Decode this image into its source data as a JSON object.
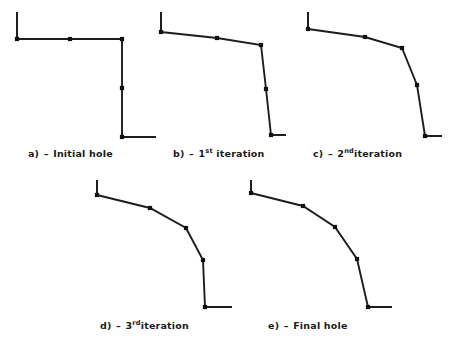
{
  "figure": {
    "kind": "line-diagram-multipanel",
    "background_color": "#ffffff",
    "stroke_color": "#1d1d1d",
    "node_color": "#101010",
    "panel_count": 5
  },
  "captions": {
    "a": {
      "label": "a)",
      "dash": "–",
      "text": "Initial hole",
      "sup": ""
    },
    "b": {
      "label": "b)",
      "dash": "–",
      "text": "1",
      "sup": "st",
      "tail": " iteration"
    },
    "c": {
      "label": "c)",
      "dash": "–",
      "text": "2",
      "sup": "nd",
      "tail": "iteration"
    },
    "d": {
      "label": "d)",
      "dash": "–",
      "text": "3",
      "sup": "rd",
      "tail": "iteration"
    },
    "e": {
      "label": "e)",
      "dash": "–",
      "text": "Final hole",
      "sup": ""
    }
  },
  "chart_data": {
    "type": "line",
    "title": "",
    "xlabel": "",
    "ylabel": "",
    "grid": false,
    "legend": "none",
    "axis_note": "schematic hole-profile shapes, pixel coordinates of the 467x355 canvas",
    "xlim": [
      0,
      467
    ],
    "ylim": [
      355,
      0
    ],
    "panels": [
      {
        "id": "a",
        "caption": "a) - Initial hole",
        "stub_top": [
          [
            17,
            12
          ],
          [
            17,
            39
          ]
        ],
        "profile": [
          [
            17,
            39
          ],
          [
            70,
            39
          ],
          [
            122,
            39
          ],
          [
            122,
            88
          ],
          [
            122,
            137
          ]
        ],
        "nodes": [
          [
            17,
            39
          ],
          [
            70,
            39
          ],
          [
            122,
            39
          ],
          [
            122,
            88
          ],
          [
            122,
            137
          ]
        ],
        "stub_bottom": [
          [
            122,
            137
          ],
          [
            156,
            137
          ]
        ]
      },
      {
        "id": "b",
        "caption": "b) - 1st iteration",
        "stub_top": [
          [
            161,
            12
          ],
          [
            161,
            32
          ]
        ],
        "profile": [
          [
            161,
            32
          ],
          [
            217,
            38
          ],
          [
            261,
            45
          ],
          [
            266,
            89
          ],
          [
            271,
            135
          ]
        ],
        "nodes": [
          [
            161,
            32
          ],
          [
            217,
            38
          ],
          [
            261,
            45
          ],
          [
            266,
            89
          ],
          [
            271,
            135
          ]
        ],
        "stub_bottom": [
          [
            271,
            135
          ],
          [
            286,
            135
          ]
        ]
      },
      {
        "id": "c",
        "caption": "c) - 2nd iteration",
        "stub_top": [
          [
            308,
            12
          ],
          [
            308,
            29
          ]
        ],
        "profile": [
          [
            308,
            29
          ],
          [
            365,
            37
          ],
          [
            402,
            48
          ],
          [
            417,
            85
          ],
          [
            425,
            136
          ]
        ],
        "nodes": [
          [
            308,
            29
          ],
          [
            365,
            37
          ],
          [
            402,
            48
          ],
          [
            417,
            85
          ],
          [
            425,
            136
          ]
        ],
        "stub_bottom": [
          [
            425,
            136
          ],
          [
            442,
            136
          ]
        ]
      },
      {
        "id": "d",
        "caption": "d) - 3rd iteration",
        "stub_top": [
          [
            97,
            180
          ],
          [
            97,
            195
          ]
        ],
        "profile": [
          [
            97,
            195
          ],
          [
            150,
            208
          ],
          [
            186,
            228
          ],
          [
            203,
            260
          ],
          [
            205,
            307
          ]
        ],
        "nodes": [
          [
            97,
            195
          ],
          [
            150,
            208
          ],
          [
            186,
            228
          ],
          [
            203,
            260
          ],
          [
            205,
            307
          ]
        ],
        "stub_bottom": [
          [
            205,
            307
          ],
          [
            232,
            307
          ]
        ]
      },
      {
        "id": "e",
        "caption": "e) - Final hole",
        "stub_top": [
          [
            251,
            180
          ],
          [
            251,
            193
          ]
        ],
        "profile": [
          [
            251,
            193
          ],
          [
            303,
            206
          ],
          [
            335,
            227
          ],
          [
            357,
            259
          ],
          [
            368,
            307
          ]
        ],
        "nodes": [
          [
            251,
            193
          ],
          [
            303,
            206
          ],
          [
            335,
            227
          ],
          [
            357,
            259
          ],
          [
            368,
            307
          ]
        ],
        "stub_bottom": [
          [
            368,
            307
          ],
          [
            392,
            307
          ]
        ]
      }
    ]
  }
}
